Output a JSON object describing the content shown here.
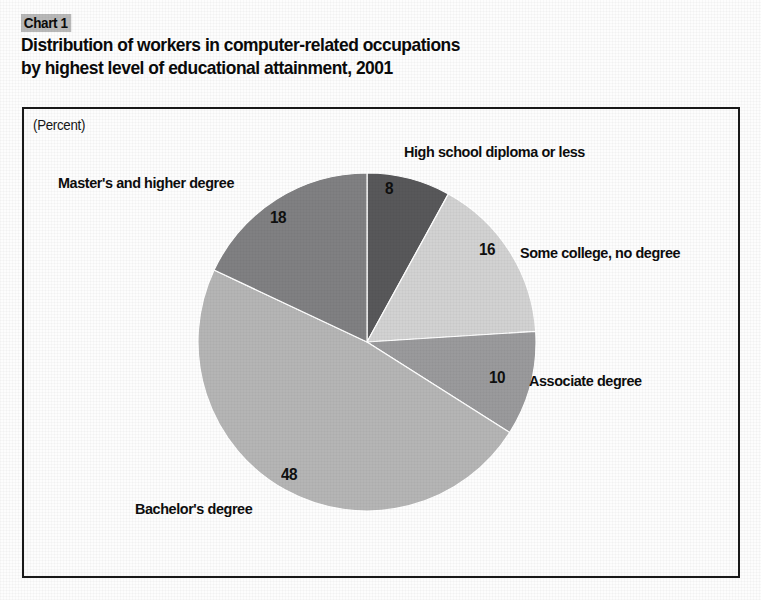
{
  "header": {
    "chart_number": "Chart 1",
    "title_line_1": "Distribution of workers in computer-related occupations",
    "title_line_2": "by highest level of educational attainment, 2001"
  },
  "plot": {
    "unit_label": "(Percent)"
  },
  "chart_data": {
    "type": "pie",
    "title": "Distribution of workers in computer-related occupations by highest level of educational attainment, 2001",
    "subtitle": "",
    "xlabel": "",
    "ylabel": "",
    "unit": "Percent",
    "grid": false,
    "legend_position": "none (labels placed around pie)",
    "start_angle_deg": 0,
    "direction": "clockwise",
    "categories": [
      "High school diploma or less",
      "Some college, no degree",
      "Associate degree",
      "Bachelor's degree",
      "Master's and higher degree"
    ],
    "values": [
      8,
      16,
      10,
      48,
      18
    ],
    "value_labels": [
      "8",
      "16",
      "10",
      "48",
      "18"
    ],
    "slice_colors": [
      "#58585a",
      "#d2d2d2",
      "#9a9a9c",
      "#b5b5b5",
      "#808082"
    ],
    "total": 100,
    "slices": [
      {
        "label": "High school diploma or less",
        "value": 8,
        "value_label": "8",
        "color": "#58585a"
      },
      {
        "label": "Some college, no degree",
        "value": 16,
        "value_label": "16",
        "color": "#d2d2d2"
      },
      {
        "label": "Associate degree",
        "value": 10,
        "value_label": "10",
        "color": "#9a9a9c"
      },
      {
        "label": "Bachelor's degree",
        "value": 48,
        "value_label": "48",
        "color": "#b5b5b5"
      },
      {
        "label": "Master's and higher degree",
        "value": 18,
        "value_label": "18",
        "color": "#808082"
      }
    ]
  },
  "colors": {
    "frame": "#1a1a1a",
    "badge_background": "#b8b8b8",
    "text": "#0a0a0a",
    "page_background": "#fdfdfd"
  }
}
